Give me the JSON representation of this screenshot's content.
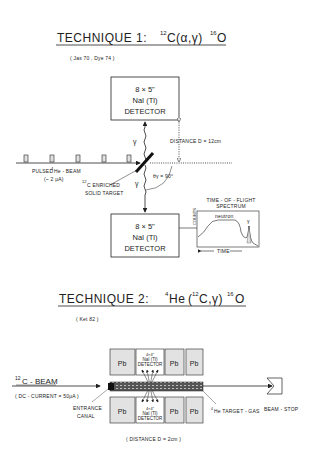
{
  "technique1": {
    "title_prefix": "TECHNIQUE  1:",
    "reaction": {
      "target_mass": "12",
      "target": "C",
      "process": "(α,γ)",
      "product_mass": "16",
      "product": "O"
    },
    "references": "( Jas 70 , Dye 74 )",
    "top_detector": {
      "line1": "8 × 5\"",
      "line2": "NaI (Tl)",
      "line3": "DETECTOR"
    },
    "bottom_detector": {
      "line1": "8 × 5\"",
      "line2": "NaI (Tl)",
      "line3": "DETECTOR"
    },
    "gamma_label": "γ",
    "distance_label": "DISTANCE  D = 12cm",
    "beam_label_line1_prefix": "PULSED",
    "beam_mass": "4",
    "beam_label_line1_suffix": "He - BEAM",
    "beam_label_line2": "(~ 2 μA)",
    "target_label_mass": "12",
    "target_label_line1": "C ENRICHED",
    "target_label_line2": "SOLID TARGET",
    "angle_label": "θγ = 90°",
    "tof": {
      "title_line1": "TIME - OF - FLIGHT",
      "title_line2": "SPECTRUM",
      "ylabel": "COUNTS",
      "neutron_label": "neutron",
      "gamma_label": "γ",
      "xlabel": "TIME"
    }
  },
  "technique2": {
    "title_prefix": "TECHNIQUE  2:",
    "reaction": {
      "beam_mass": "4",
      "beam": "He",
      "process_open": "(",
      "proj_mass": "12",
      "proj": "C,γ)",
      "product_mass": "16",
      "product": "O"
    },
    "references": "( Ket 82 )",
    "beam_mass": "12",
    "beam_label": "C - BEAM",
    "beam_current": "( DC - CURRENT = 50μA )",
    "entrance_line1": "ENTRANCE",
    "entrance_line2": "CANAL",
    "shield_label": "Pb",
    "detector_top": {
      "line1": "4×4\"",
      "line2": "NaI (Tl)",
      "line3": "DETECTOR"
    },
    "detector_bottom": {
      "line1": "4×4\"",
      "line2": "NaI (Tl)",
      "line3": "DETECTOR"
    },
    "gas_mass": "4",
    "gas_label": "He TARGET - GAS",
    "beam_stop": "BEAM - STOP",
    "distance_label": "( DISTANCE  D = 2cm )"
  }
}
